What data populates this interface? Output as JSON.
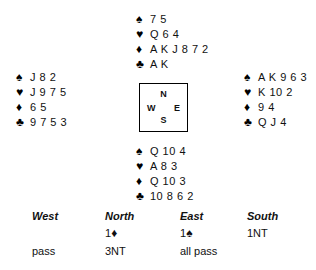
{
  "suits": {
    "spade": "♠",
    "heart": "♥",
    "diamond": "♦",
    "club": "♣"
  },
  "hands": {
    "north": {
      "position_label": "North",
      "spades": "7 5",
      "hearts": "Q 6 4",
      "diamonds": "A K J 8 7 2",
      "clubs": "A K"
    },
    "west": {
      "position_label": "West",
      "spades": "J 8 2",
      "hearts": "J 9 7 5",
      "diamonds": "6 5",
      "clubs": "9 7 5 3"
    },
    "east": {
      "position_label": "East",
      "spades": "A K 9 6 3",
      "hearts": "K 10 2",
      "diamonds": "9 4",
      "clubs": "Q J 4"
    },
    "south": {
      "position_label": "South",
      "spades": "Q 10 4",
      "hearts": "A 8 3",
      "diamonds": "Q 10 3",
      "clubs": "10 8 6 2"
    }
  },
  "compass": {
    "north": "N",
    "west": "W",
    "east": "E",
    "south": "S"
  },
  "auction": {
    "headers": {
      "west": "West",
      "north": "North",
      "east": "East",
      "south": "South"
    },
    "rows": [
      {
        "west": "",
        "north_level": "1",
        "north_suit": "♦",
        "east_level": "1",
        "east_suit": "♠",
        "south": "1NT"
      },
      {
        "west": "pass",
        "north": "3NT",
        "east": "all pass",
        "south": ""
      }
    ]
  },
  "colors": {
    "ink": "#111111",
    "line": "#000000",
    "background": "#ffffff"
  }
}
